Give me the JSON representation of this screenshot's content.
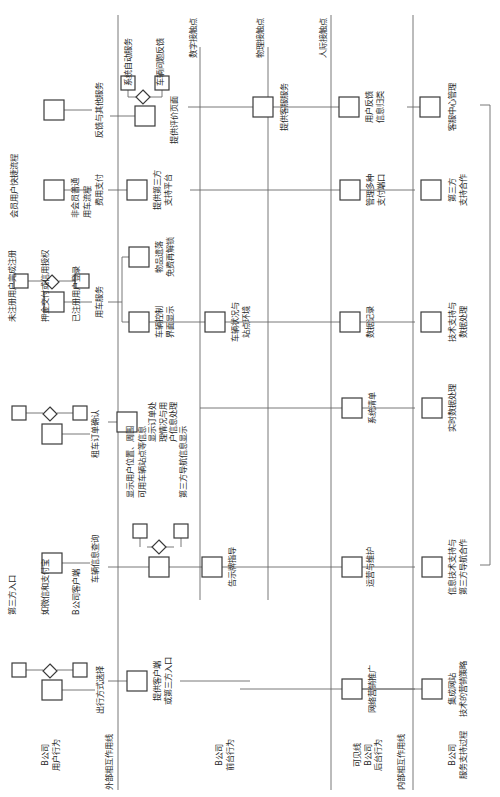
{
  "diagram": {
    "orientation": "rotated-90-ccw",
    "lanes": {
      "user_behavior": "B公司\n用户行为",
      "frontstage": "B公司\n前台行为",
      "backstage": "可见线\nB公司\n后台行为",
      "support": "B公司\n服务支持过程"
    },
    "lines": {
      "external_interaction": "外部相互作用线",
      "digital_touchpoint": "数字接触点",
      "physical_touchpoint": "物理接触点",
      "human_touchpoint": "人际接触点",
      "internal_interaction": "内部相互作用线"
    },
    "user_steps": [
      {
        "label": "出行方式选择",
        "options": [
          "第三方入口",
          "如微信和支付宝",
          "B公司客户端"
        ]
      },
      {
        "label": "车辆信息查询"
      },
      {
        "label": "租车订单确认",
        "options": [
          "未注册用户完成注册",
          "押金交付或信用授权",
          "已注册用户登录"
        ]
      },
      {
        "label": "用车服务",
        "options": [
          "会员用户快捷流程",
          "非会员普通\n用车流程"
        ]
      },
      {
        "label": "费用支付"
      },
      {
        "label": "反馈与其他服务"
      }
    ],
    "digital_steps": [
      {
        "label": "提供客户端\n或第三方入口"
      },
      {
        "label": "",
        "options": [
          "显示用户位置、周围\n可用车辆站点等信息",
          "第三方导航信息显示"
        ]
      },
      {
        "label": "显示订单处\n理情况与用\n户信息处理"
      },
      {
        "label": "车辆控制\n界面显示"
      },
      {
        "label": "物品遗落\n免费再解锁"
      },
      {
        "label": "提供第三方\n支持平台"
      },
      {
        "label": "提供评价页面",
        "options": [
          "系统自动服务",
          "车辆问题反馈"
        ]
      }
    ],
    "physical_steps": [
      {
        "label": "告示牌指导"
      },
      {
        "label": "车辆状况与\n站点环境"
      },
      {
        "label": "提供客服服务"
      }
    ],
    "backstage_steps": [
      {
        "label": "网络营销推广"
      },
      {
        "label": "运营与维护"
      },
      {
        "label": "系统清单"
      },
      {
        "label": "数据记录"
      },
      {
        "label": "管理多种\n支付端口"
      },
      {
        "label": "用户反馈\n信息归类"
      }
    ],
    "support_steps": [
      {
        "label": "集成网站\n技术的营销策略"
      },
      {
        "label": "信息技术支持与\n第三方导航合作"
      },
      {
        "label": "实时数据处理"
      },
      {
        "label": "技术支持与\n数据处理"
      },
      {
        "label": "第三方\n支持合作"
      },
      {
        "label": "客服中心管理"
      }
    ]
  }
}
